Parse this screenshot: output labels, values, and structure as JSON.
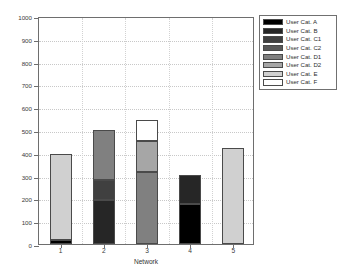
{
  "chart_data": {
    "type": "bar",
    "subtype": "stacked-bar",
    "title": "",
    "xlabel": "Network",
    "ylabel": "Aggregate Demand (Mb/s)",
    "categories": [
      "1",
      "2",
      "3",
      "4",
      "5"
    ],
    "xlim": [
      0.5,
      5.5
    ],
    "ylim": [
      0,
      1000
    ],
    "yticks": [
      0,
      100,
      200,
      300,
      400,
      500,
      600,
      700,
      800,
      900,
      1000
    ],
    "ytick_labels": [
      "0",
      "100",
      "200",
      "300",
      "400",
      "500",
      "600",
      "700",
      "800",
      "900",
      "1000"
    ],
    "grid": true,
    "legend_position": "outside-top-right",
    "series": [
      {
        "name": "User Cat. A",
        "color": "#000000",
        "values": [
          18,
          0,
          0,
          175,
          0
        ]
      },
      {
        "name": "User Cat. B",
        "color": "#262626",
        "values": [
          0,
          192,
          0,
          128,
          0
        ]
      },
      {
        "name": "User Cat. C1",
        "color": "#404040",
        "values": [
          0,
          88,
          0,
          0,
          0
        ]
      },
      {
        "name": "User Cat. C2",
        "color": "#595959",
        "values": [
          0,
          0,
          0,
          0,
          0
        ]
      },
      {
        "name": "User Cat. D1",
        "color": "#808080",
        "values": [
          0,
          222,
          315,
          0,
          0
        ]
      },
      {
        "name": "User Cat. D2",
        "color": "#a6a6a6",
        "values": [
          0,
          0,
          137,
          0,
          0
        ]
      },
      {
        "name": "User Cat. E",
        "color": "#d0d0d0",
        "values": [
          377,
          0,
          0,
          0,
          423
        ]
      },
      {
        "name": "User Cat. F",
        "color": "#ffffff",
        "values": [
          0,
          0,
          91,
          0,
          0
        ]
      }
    ],
    "totals": [
      395,
      502,
      543,
      303,
      423
    ]
  },
  "legend": {
    "entries": [
      {
        "label": "User Cat. A"
      },
      {
        "label": "User Cat. B"
      },
      {
        "label": "User Cat. C1"
      },
      {
        "label": "User Cat. C2"
      },
      {
        "label": "User Cat. D1"
      },
      {
        "label": "User Cat. D2"
      },
      {
        "label": "User Cat. E"
      },
      {
        "label": "User Cat. F"
      }
    ]
  },
  "colors": {
    "axis": "#6e6e6e",
    "grid": "#c8c8c8",
    "edge": "#4a4a4a",
    "background": "#ffffff"
  }
}
